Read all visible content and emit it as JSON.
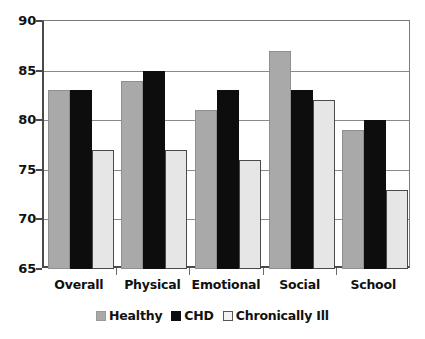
{
  "chart_data": {
    "type": "bar",
    "title": "",
    "subtitle": "",
    "xlabel": "",
    "ylabel": "",
    "categories": [
      "Overall",
      "Physical",
      "Emotional",
      "Social",
      "School"
    ],
    "series": [
      {
        "name": "Healthy",
        "color": "#a9a9a9",
        "values": [
          83,
          84,
          81,
          87,
          79
        ]
      },
      {
        "name": "CHD",
        "color": "#0d0d0d",
        "values": [
          83,
          85,
          83,
          83,
          80
        ]
      },
      {
        "name": "Chronically Ill",
        "color": "#e6e6e6",
        "values": [
          77,
          77,
          76,
          82,
          73
        ]
      }
    ],
    "ylim": [
      65,
      90
    ],
    "yticks": [
      65,
      70,
      75,
      80,
      85,
      90
    ],
    "ytick_labels": [
      "65",
      "70",
      "75",
      "80",
      "85",
      "90"
    ],
    "grid": true,
    "grid_axis": "y",
    "legend_position": "bottom",
    "annotations": []
  },
  "legend": {
    "items": [
      {
        "label": "Healthy",
        "swatch": "healthy-swatch"
      },
      {
        "label": "CHD",
        "swatch": "chd-swatch"
      },
      {
        "label": "Chronically Ill",
        "swatch": "chronically-ill-swatch"
      }
    ]
  },
  "axes": {
    "y": {
      "labels": [
        "90",
        "85",
        "80",
        "75",
        "70",
        "65"
      ]
    },
    "x": {
      "labels": [
        "Overall",
        "Physical",
        "Emotional",
        "Social",
        "School"
      ]
    }
  }
}
